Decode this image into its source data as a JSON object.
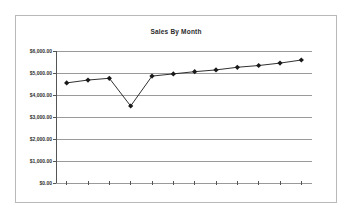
{
  "chart_data": {
    "type": "line",
    "title": "Sales By Month",
    "xlabel": "",
    "ylabel": "",
    "ylim": [
      0,
      6000
    ],
    "yticks": [
      0,
      1000,
      2000,
      3000,
      4000,
      5000,
      6000
    ],
    "ytick_labels": [
      "$0.00",
      "$1,000.00",
      "$2,000.00",
      "$3,000.00",
      "$4,000.00",
      "$5,000.00",
      "$6,000.00"
    ],
    "grid": true,
    "legend": "none",
    "categories": [
      "1",
      "2",
      "3",
      "4",
      "5",
      "6",
      "7",
      "8",
      "9",
      "10",
      "11",
      "12"
    ],
    "series": [
      {
        "name": "Sales",
        "marker": "diamond",
        "color": "#1a1a1a",
        "values": [
          4550,
          4680,
          4760,
          3500,
          4860,
          4960,
          5060,
          5140,
          5260,
          5340,
          5450,
          5590
        ]
      }
    ]
  },
  "axis": {
    "tick_count": 12,
    "line_color": "#555555",
    "grid_color": "#9a9a9a"
  },
  "frame": {
    "border_color": "#b9b9b9"
  }
}
